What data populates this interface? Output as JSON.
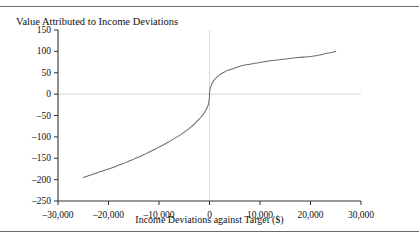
{
  "figure": {
    "title": "Value Attributed to Income Deviations",
    "top_rule": true,
    "bottom_rule": true
  },
  "chart_data": {
    "type": "line",
    "title": "Value Attributed to Income Deviations",
    "xlabel": "Income Deviations against Target ($)",
    "ylabel": "",
    "xlim": [
      -30000,
      30000
    ],
    "ylim": [
      -250,
      150
    ],
    "xticks": [
      -30000,
      -20000,
      -10000,
      0,
      10000,
      20000,
      30000
    ],
    "xtick_labels": [
      "–30,000",
      "–20,000",
      "–10,000",
      "0",
      "10,000",
      "20,000",
      "30,000"
    ],
    "yticks": [
      150,
      100,
      50,
      0,
      -50,
      -100,
      -150,
      -200,
      -250
    ],
    "ytick_labels": [
      "150",
      "100",
      "50",
      "0",
      "–50",
      "–100",
      "–150",
      "–200",
      "–250"
    ],
    "grid": false,
    "zero_gridlines": {
      "vertical_x": 0,
      "horizontal_y": 0,
      "color": "#d9d9d9"
    },
    "legend": null,
    "series": [
      {
        "name": "Value function",
        "color": "#6e6e6e",
        "linewidth": 1,
        "x": [
          -25000,
          -24000,
          -23000,
          -22000,
          -21000,
          -20000,
          -19000,
          -18000,
          -17000,
          -16000,
          -15000,
          -14000,
          -13000,
          -12000,
          -11000,
          -10000,
          -9000,
          -8000,
          -7000,
          -6000,
          -5000,
          -4000,
          -3500,
          -3000,
          -2500,
          -2000,
          -1500,
          -1200,
          -1000,
          -800,
          -600,
          -400,
          -250,
          -150,
          -80,
          -30,
          0,
          30,
          80,
          150,
          250,
          400,
          600,
          800,
          1000,
          1200,
          1500,
          2000,
          2500,
          3000,
          3500,
          4000,
          5000,
          6000,
          7000,
          8000,
          9000,
          10000,
          11000,
          12000,
          13000,
          14000,
          15000,
          16000,
          17000,
          18000,
          19000,
          20000,
          21000,
          22000,
          23000,
          24000,
          25000
        ],
        "y": [
          -195,
          -191,
          -187,
          -183,
          -179,
          -175,
          -171,
          -166,
          -162,
          -157,
          -152,
          -147,
          -142,
          -136,
          -130,
          -124,
          -118,
          -111,
          -104,
          -97,
          -89,
          -80,
          -75,
          -70,
          -64,
          -58,
          -51,
          -47,
          -43,
          -39,
          -35,
          -30,
          -25,
          -20,
          -15,
          -9,
          0,
          5,
          9,
          13,
          17,
          22,
          27,
          31,
          34,
          37,
          40,
          45,
          49,
          52,
          55,
          57,
          61,
          65,
          68,
          70,
          72,
          74,
          76,
          78,
          79,
          81,
          82,
          84,
          85,
          86,
          87,
          88,
          90,
          92,
          95,
          97,
          100
        ]
      }
    ]
  },
  "axis": {
    "xlabel": "Income Deviations against Target ($)"
  }
}
